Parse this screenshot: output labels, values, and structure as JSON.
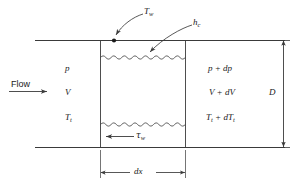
{
  "figure": {
    "kind": "duct-control-volume-diagram",
    "colors": {
      "line": "#3a3a3a",
      "text": "#1a1a1a",
      "background": "#ffffff"
    }
  },
  "labels": {
    "wall_temperature": "T",
    "wall_temperature_sub": "w",
    "heat_transfer_coefficient": "h",
    "heat_transfer_coefficient_sub": "c",
    "flow": "Flow",
    "inlet_pressure": "p",
    "inlet_velocity": "V",
    "inlet_total_temperature": "T",
    "inlet_total_temperature_sub": "t",
    "outlet_pressure": "p + dp",
    "outlet_velocity": "V + dV",
    "outlet_total_temperature": "T",
    "outlet_total_temperature_sub": "t",
    "outlet_total_temperature_delta": " + dT",
    "outlet_total_temperature_delta_sub": "t",
    "wall_shear_stress": "τ",
    "wall_shear_stress_sub": "w",
    "diameter": "D",
    "length_increment": "dx"
  },
  "dimensions": {
    "diameter_label": "D",
    "length_label": "dx"
  }
}
